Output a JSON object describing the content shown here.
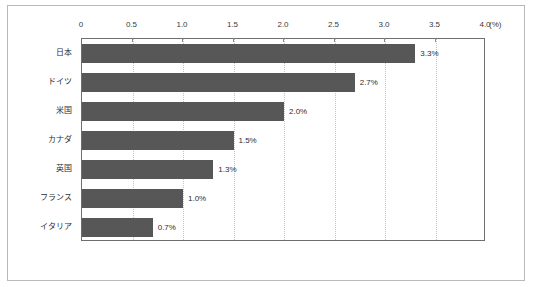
{
  "chart_data": {
    "type": "bar",
    "orientation": "horizontal",
    "title": "",
    "xlabel": "(%)",
    "ylabel": "",
    "xlim": [
      0,
      4.0
    ],
    "grid": true,
    "legend": false,
    "unit_label": "(%)",
    "categories": [
      "日本",
      "ドイツ",
      "米国",
      "カナダ",
      "英国",
      "フランス",
      "イタリア"
    ],
    "values": [
      3.3,
      2.7,
      2.0,
      1.5,
      1.3,
      1.0,
      0.7
    ],
    "value_labels": [
      "3.3%",
      "2.7%",
      "2.0%",
      "1.5%",
      "1.3%",
      "1.0%",
      "0.7%"
    ],
    "tick_values": [
      0,
      0.5,
      1.0,
      1.5,
      2.0,
      2.5,
      3.0,
      3.5,
      4.0
    ],
    "tick_labels": [
      "0",
      "0.5",
      "1.0",
      "1.5",
      "2.0",
      "2.5",
      "3.0",
      "3.5",
      "4.0"
    ],
    "colors": {
      "bar": "#575757",
      "gridline": "#c4c4c4",
      "plot_border": "#6f6f6f",
      "outer_frame": "#b9b9b9",
      "text": "#2e2e2e",
      "background": "#ffffff"
    }
  }
}
